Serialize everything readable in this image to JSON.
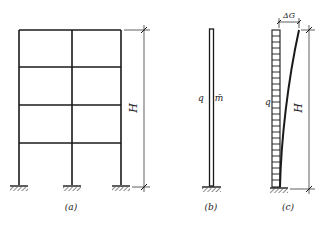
{
  "figure_a": {
    "caption": "(a)",
    "dimension_label": "H",
    "description": "Four-storey, two-bay rigid frame with fixed supports"
  },
  "figure_b": {
    "caption": "(b)",
    "load_label": "q",
    "mass_label": "m̄",
    "description": "Equivalent cantilever column with distributed mass"
  },
  "figure_c": {
    "caption": "(c)",
    "load_label": "q",
    "dimension_label": "H",
    "displacement_label": "ΔG",
    "description": "Cantilever under uniform load q with deflected shape and top displacement"
  },
  "colors": {
    "line": "#1a1a1a",
    "background": "#ffffff"
  }
}
